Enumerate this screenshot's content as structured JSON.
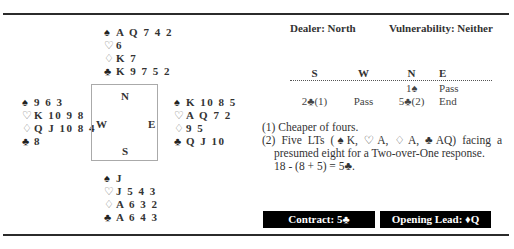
{
  "deal": {
    "north": {
      "spades": "A Q 7 4 2",
      "hearts": "6",
      "diamonds": "K 7",
      "clubs": "K 9 7 5 2"
    },
    "west": {
      "spades": "9 6 3",
      "hearts": "K 10 9 8",
      "diamonds": "Q J 10 8 4",
      "clubs": "8"
    },
    "east": {
      "spades": "K 10 8 5",
      "hearts": "A Q 7 2",
      "diamonds": "9 5",
      "clubs": "Q J 10"
    },
    "south": {
      "spades": "J",
      "hearts": "J 5 4 3",
      "diamonds": "A 6 3 2",
      "clubs": "A 6 4 3"
    }
  },
  "suit_symbols": {
    "spades": "♠",
    "hearts": "♡",
    "diamonds": "♢",
    "clubs": "♣"
  },
  "compass": {
    "n": "N",
    "s": "S",
    "w": "W",
    "e": "E"
  },
  "dealer": "Dealer: North",
  "vulnerability": "Vulnerability: Neither",
  "auction": {
    "headers": [
      "S",
      "W",
      "N",
      "E"
    ],
    "rows": [
      [
        "",
        "",
        "1♠",
        "Pass"
      ],
      [
        "2♣(1)",
        "Pass",
        "5♣(2)",
        "End"
      ]
    ]
  },
  "notes": {
    "note1": "(1) Cheaper of fours.",
    "note2": "(2) Five LTs (♠K, ♡A, ♢A, ♣AQ) facing a presumed eight for a Two-over-One response.",
    "calc": "18 - (8 + 5) = 5♣."
  },
  "contract": "Contract: 5♣",
  "opening_lead": "Opening Lead: ♦Q"
}
